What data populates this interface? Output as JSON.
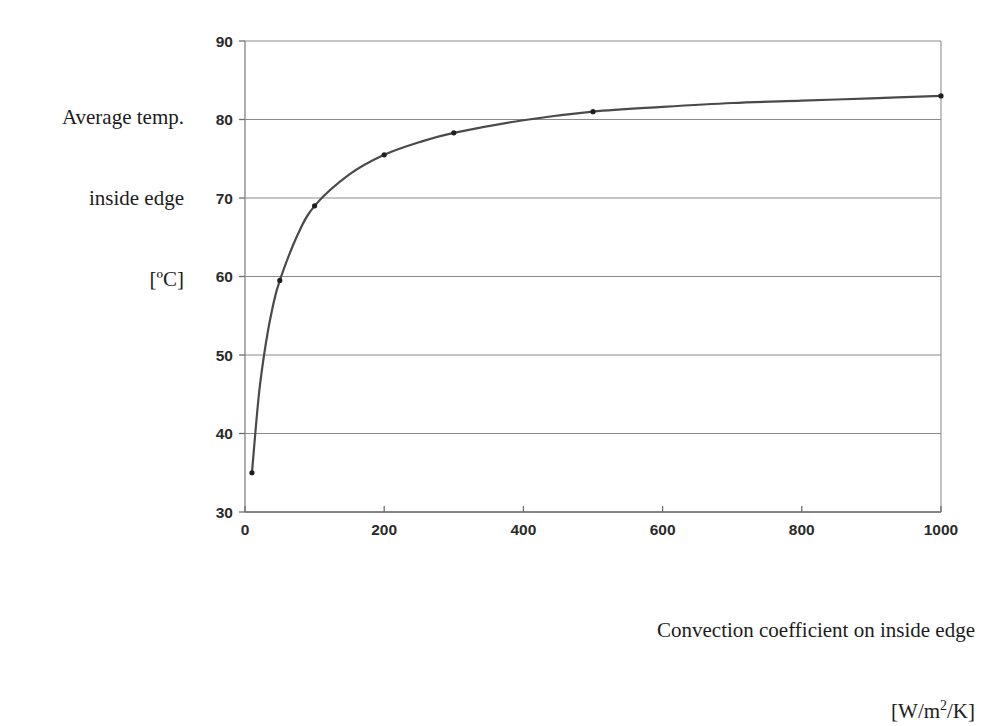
{
  "figure": {
    "background_color": "#ffffff",
    "plot_area": {
      "left_px": 245,
      "right_px": 941,
      "top_px": 41,
      "bottom_px": 512,
      "border_color": "#8c8c8c",
      "grid_color": "#8a8a8a"
    }
  },
  "chart_data": {
    "type": "line",
    "title": "",
    "subtitle": "",
    "xlabel": "Convection coefficient on inside edge [W/m2/K]",
    "ylabel": "Average temp. inside edge [°C]",
    "xlim": [
      0,
      1000
    ],
    "ylim": [
      30,
      90
    ],
    "xticks": [
      0,
      200,
      400,
      600,
      800,
      1000
    ],
    "yticks": [
      30,
      40,
      50,
      60,
      70,
      80,
      90
    ],
    "xtick_labels": [
      "0",
      "200",
      "400",
      "600",
      "800",
      "1000"
    ],
    "ytick_labels": [
      "30",
      "40",
      "50",
      "60",
      "70",
      "80",
      "90"
    ],
    "grid": "horizontal",
    "legend": "none",
    "series": [
      {
        "name": "Average temp. inside edge",
        "line_color": "#4a4a4a",
        "line_width": 2.2,
        "marker": "dot",
        "marker_color": "#1f1f1f",
        "x": [
          10,
          20,
          30,
          40,
          50,
          75,
          100,
          150,
          200,
          250,
          300,
          400,
          500,
          600,
          700,
          800,
          900,
          1000
        ],
        "y": [
          35.0,
          45.0,
          51.5,
          56.2,
          59.5,
          65.2,
          69.0,
          73.0,
          75.5,
          77.1,
          78.3,
          79.9,
          81.0,
          81.6,
          82.1,
          82.4,
          82.7,
          83.0
        ],
        "marked_points": [
          {
            "x": 10,
            "y": 35.0
          },
          {
            "x": 50,
            "y": 59.5
          },
          {
            "x": 100,
            "y": 69.0
          },
          {
            "x": 200,
            "y": 75.5
          },
          {
            "x": 300,
            "y": 78.3
          },
          {
            "x": 500,
            "y": 81.0
          },
          {
            "x": 1000,
            "y": 83.0
          }
        ]
      }
    ]
  },
  "labels": {
    "y_axis_title_line1": "Average temp.",
    "y_axis_title_line2": "inside edge",
    "y_axis_title_line3": "[ºC]",
    "x_axis_title_line1": "Convection coefficient on inside edge",
    "x_axis_title_unit_prefix": "[W/m",
    "x_axis_title_unit_sup": "2",
    "x_axis_title_unit_suffix": "/K]"
  }
}
